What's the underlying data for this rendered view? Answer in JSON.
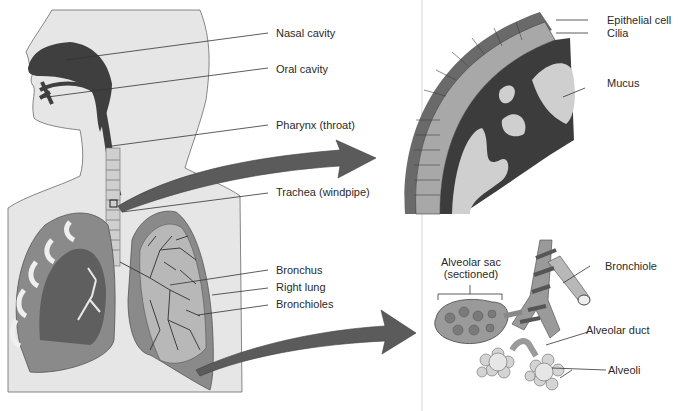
{
  "figure": {
    "colors": {
      "body_fill": "#e6e6e6",
      "body_outline": "#6a6a6a",
      "airway_dark": "#3f3f3f",
      "tissue_mid": "#8a8a8a",
      "tissue_light": "#b8b8b8",
      "arrow": "#5b5b5b",
      "leader_line": "#333333",
      "divider": "#e4e4e4"
    }
  },
  "main_panel": {
    "name": "Head and torso cutaway",
    "labels": [
      {
        "id": "nasal-cavity",
        "text": "Nasal cavity"
      },
      {
        "id": "oral-cavity",
        "text": "Oral cavity"
      },
      {
        "id": "pharynx",
        "text": "Pharynx (throat)"
      },
      {
        "id": "trachea",
        "text": "Trachea (windpipe)"
      },
      {
        "id": "bronchus",
        "text": "Bronchus"
      },
      {
        "id": "right-lung",
        "text": "Right lung"
      },
      {
        "id": "bronchioles",
        "text": "Bronchioles"
      }
    ]
  },
  "inset_top": {
    "name": "Trachea lining cross-section",
    "labels": [
      {
        "id": "epithelial-cell",
        "text": "Epithelial cell"
      },
      {
        "id": "cilia",
        "text": "Cilia"
      },
      {
        "id": "mucus",
        "text": "Mucus"
      }
    ]
  },
  "inset_bottom": {
    "name": "Alveolar structure",
    "labels": [
      {
        "id": "alveolar-sac",
        "line1": "Alveolar sac",
        "line2": "(sectioned)"
      },
      {
        "id": "bronchiole",
        "text": "Bronchiole"
      },
      {
        "id": "alveolar-duct",
        "text": "Alveolar duct"
      },
      {
        "id": "alveoli",
        "text": "Alveoli"
      }
    ]
  }
}
